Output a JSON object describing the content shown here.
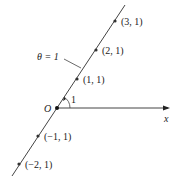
{
  "diagram": {
    "title_label": "θ = 1",
    "origin_label": "O",
    "axis_label": "x",
    "angle_label": "1",
    "points": [
      {
        "label": "(3, 1)",
        "x": 115,
        "y": 21
      },
      {
        "label": "(2, 1)",
        "x": 96,
        "y": 50
      },
      {
        "label": "(1, 1)",
        "x": 77,
        "y": 79
      },
      {
        "label": "(−1, 1)",
        "x": 38,
        "y": 136
      },
      {
        "label": "(−2, 1)",
        "x": 19,
        "y": 164
      }
    ],
    "colors": {
      "line": "#444444",
      "point": "#333333"
    }
  }
}
